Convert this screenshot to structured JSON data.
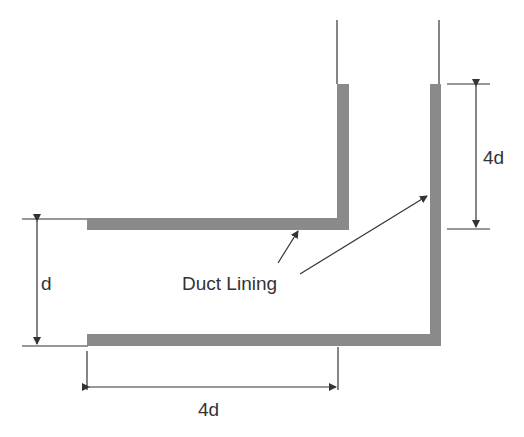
{
  "diagram": {
    "type": "duct-elbow-schematic",
    "labels": {
      "lining": "Duct Lining",
      "inlet_width": "d",
      "horizontal_length": "4d",
      "vertical_length": "4d"
    },
    "colors": {
      "lining": "#8a8a8a",
      "line": "#333333",
      "text": "#333333",
      "background": "#ffffff"
    }
  }
}
